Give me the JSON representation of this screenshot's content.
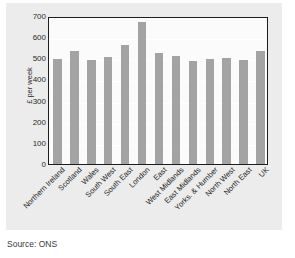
{
  "chart_data": {
    "type": "bar",
    "title": "",
    "subtitle": "",
    "xlabel": "",
    "ylabel": "£ per week",
    "ylim": [
      0,
      700
    ],
    "yticks": [
      0,
      100,
      200,
      300,
      400,
      500,
      600,
      700
    ],
    "ytick_labels": [
      "0",
      "100",
      "200",
      "300",
      "400",
      "500",
      "600",
      "700"
    ],
    "grid": true,
    "legend": null,
    "legend_position": "none",
    "bar_color": "#a3a3a3",
    "categories": [
      "Northern Ireland",
      "Scotland",
      "Wales",
      "South West",
      "South East",
      "London",
      "East",
      "West Midlands",
      "East Midlands",
      "Yorks. & Humber",
      "North West",
      "North East",
      "UK"
    ],
    "values": [
      495,
      535,
      490,
      505,
      565,
      670,
      525,
      510,
      485,
      498,
      500,
      492,
      535
    ]
  },
  "caption": {
    "source": "Source: ONS"
  },
  "colors": {
    "panel_background": "#ececec",
    "plot_background": "#fbfbfb",
    "bar": "#a3a3a3",
    "axis_line": "#1d1d1d",
    "gridline": "#ffffff",
    "text": "#1d1d1d"
  }
}
